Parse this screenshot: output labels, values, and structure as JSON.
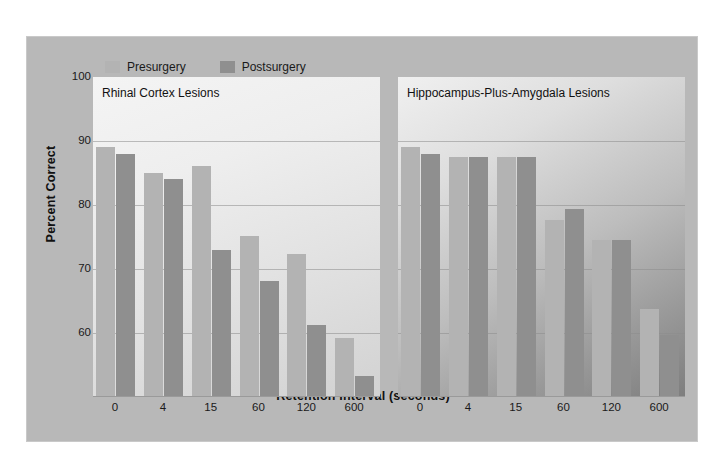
{
  "figure": {
    "background_color": "#b8b8b8"
  },
  "legend": {
    "items": [
      {
        "label": "Presurgery",
        "color": "#b3b3b3"
      },
      {
        "label": "Postsurgery",
        "color": "#8f8f8f"
      }
    ]
  },
  "axes": {
    "y_title": "Percent Correct",
    "x_title": "Retention Interval (seconds)",
    "y_ticks": [
      "100",
      "90",
      "80",
      "70",
      "60"
    ],
    "y_tick_values": [
      100,
      90,
      80,
      70,
      60
    ],
    "y_min": 50,
    "y_max": 100
  },
  "panels": [
    {
      "id": "rhinal-cortex",
      "title": "Rhinal Cortex Lesions"
    },
    {
      "id": "hippocampus-amygdala",
      "title": "Hippocampus-Plus-Amygdala Lesions"
    }
  ],
  "chart_data": {
    "type": "bar",
    "title": "",
    "xlabel": "Retention Interval (seconds)",
    "ylabel": "Percent Correct",
    "ylim": [
      50,
      100
    ],
    "grid": true,
    "legend_position": "top-left",
    "categories": [
      "0",
      "4",
      "15",
      "60",
      "120",
      "600"
    ],
    "panels": [
      {
        "name": "Rhinal Cortex Lesions",
        "series": [
          {
            "name": "Presurgery",
            "values": [
              89.0,
              85.0,
              86.1,
              75.1,
              72.3,
              59.2
            ]
          },
          {
            "name": "Postsurgery",
            "values": [
              88.0,
              84.1,
              73.0,
              68.2,
              61.3,
              53.3
            ]
          }
        ]
      },
      {
        "name": "Hippocampus-Plus-Amygdala Lesions",
        "series": [
          {
            "name": "Presurgery",
            "values": [
              89.0,
              87.5,
              87.5,
              77.7,
              74.5,
              63.7
            ]
          },
          {
            "name": "Postsurgery",
            "values": [
              88.0,
              87.5,
              87.5,
              79.4,
              74.5,
              59.7
            ]
          }
        ]
      }
    ]
  }
}
